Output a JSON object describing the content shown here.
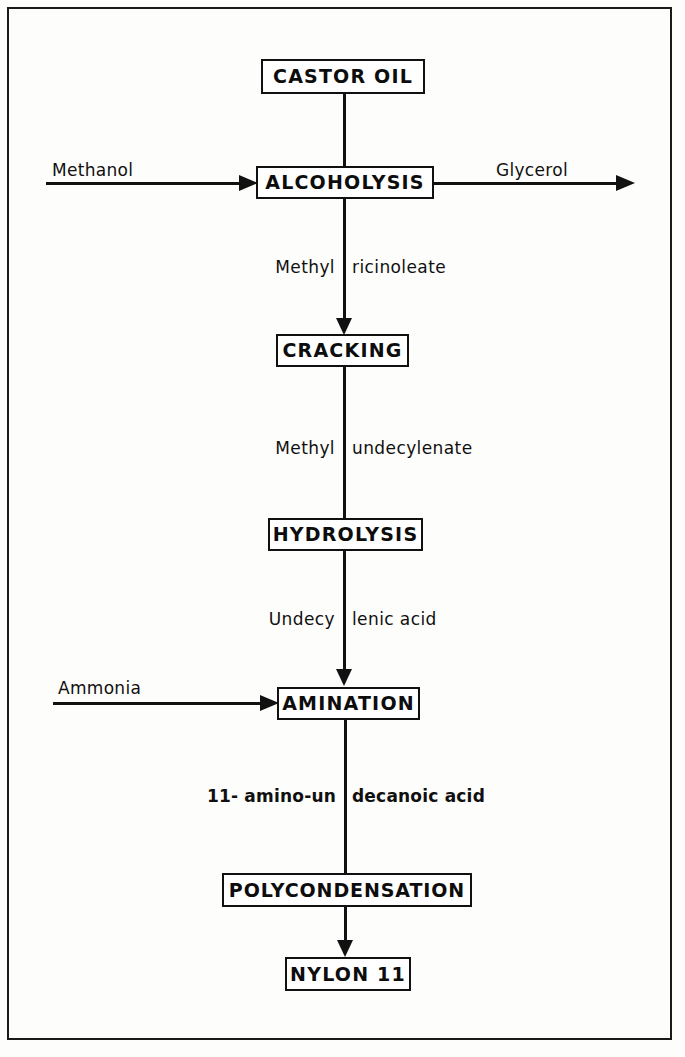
{
  "diagram": {
    "type": "process-flowchart",
    "border_color": "#1a1a1a",
    "line_color": "#111111",
    "background_color": "#fdfdfb"
  },
  "nodes": [
    {
      "id": "castor-oil",
      "label": "CASTOR OIL"
    },
    {
      "id": "alcoholysis",
      "label": "ALCOHOLYSIS"
    },
    {
      "id": "cracking",
      "label": "CRACKING"
    },
    {
      "id": "hydrolysis",
      "label": "HYDROLYSIS"
    },
    {
      "id": "amination",
      "label": "AMINATION"
    },
    {
      "id": "polycondensation",
      "label": "POLYCONDENSATION"
    },
    {
      "id": "nylon-11",
      "label": "NYLON 11"
    }
  ],
  "intermediates": [
    {
      "id": "methyl-ricinoleate",
      "left": "Methyl",
      "right": "ricinoleate",
      "full": "Methyl ricinoleate"
    },
    {
      "id": "methyl-undecylenate",
      "left": "Methyl",
      "right": "undecylenate",
      "full": "Methyl undecylenate"
    },
    {
      "id": "undecylenic-acid",
      "left": "Undecy",
      "right": "lenic acid",
      "full": "Undecylenic acid"
    },
    {
      "id": "amino-undecanoic-acid",
      "left": "11- amino-un",
      "right": "decanoic acid",
      "full": "11- amino-undecanoic acid"
    }
  ],
  "inputs": [
    {
      "id": "methanol",
      "label": "Methanol",
      "target": "alcoholysis"
    },
    {
      "id": "ammonia",
      "label": "Ammonia",
      "target": "amination"
    }
  ],
  "outputs": [
    {
      "id": "glycerol",
      "label": "Glycerol",
      "source": "alcoholysis"
    }
  ]
}
